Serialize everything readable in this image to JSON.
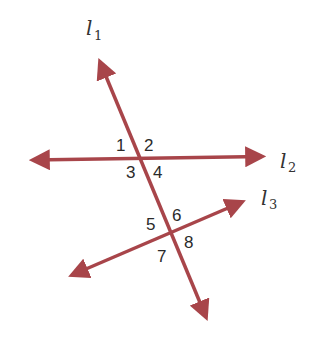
{
  "diagram": {
    "type": "geometry-transversal",
    "line_color": "#a8454a",
    "lines": [
      {
        "id": "l1",
        "label": "l",
        "subscript": "1",
        "role": "transversal",
        "x1": 96,
        "y1": 50,
        "x2": 211,
        "y2": 329
      },
      {
        "id": "l2",
        "label": "l",
        "subscript": "2",
        "role": "line",
        "x1": 20,
        "y1": 160,
        "x2": 275,
        "y2": 156
      },
      {
        "id": "l3",
        "label": "l",
        "subscript": "3",
        "role": "line",
        "x1": 60,
        "y1": 280,
        "x2": 254,
        "y2": 197
      }
    ],
    "intersections": [
      {
        "lines": [
          "l1",
          "l2"
        ],
        "angles": [
          "1",
          "2",
          "3",
          "4"
        ]
      },
      {
        "lines": [
          "l1",
          "l3"
        ],
        "angles": [
          "5",
          "6",
          "7",
          "8"
        ]
      }
    ],
    "angle_labels": {
      "a1": "1",
      "a2": "2",
      "a3": "3",
      "a4": "4",
      "a5": "5",
      "a6": "6",
      "a7": "7",
      "a8": "8"
    },
    "line_labels": {
      "l1_main": "l",
      "l1_sub": "1",
      "l2_main": "l",
      "l2_sub": "2",
      "l3_main": "l",
      "l3_sub": "3"
    }
  }
}
